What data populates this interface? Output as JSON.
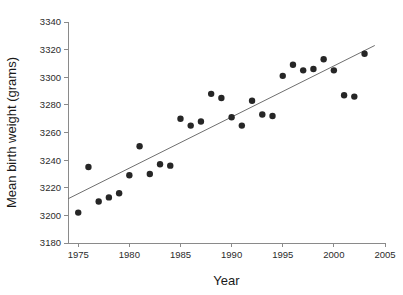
{
  "chart_data": {
    "type": "scatter",
    "title": "",
    "xlabel": "Year",
    "ylabel": "Mean birth weight (grams)",
    "xlim": [
      1974,
      2005
    ],
    "ylim": [
      3180,
      3340
    ],
    "xticks": [
      1975,
      1980,
      1985,
      1990,
      1995,
      2000,
      2005
    ],
    "xtick_labels": [
      "1975",
      "1980",
      "1985",
      "1990",
      "1995",
      "2000",
      "2005"
    ],
    "yticks": [
      3180,
      3200,
      3220,
      3240,
      3260,
      3280,
      3300,
      3320,
      3340
    ],
    "ytick_labels": [
      "3180",
      "3200",
      "3220",
      "3240",
      "3260",
      "3280",
      "3300",
      "3320",
      "3340"
    ],
    "grid": false,
    "legend": false,
    "point_color": "#262626",
    "line_color": "#6f6f6f",
    "axis_color": "#8a8a8a",
    "x": [
      1975,
      1976,
      1977,
      1978,
      1979,
      1980,
      1981,
      1982,
      1983,
      1984,
      1985,
      1986,
      1987,
      1988,
      1989,
      1990,
      1991,
      1992,
      1993,
      1994,
      1995,
      1996,
      1997,
      1998,
      1999,
      2000,
      2001,
      2002,
      2003
    ],
    "y": [
      3202,
      3235,
      3210,
      3213,
      3216,
      3229,
      3250,
      3230,
      3237,
      3236,
      3270,
      3265,
      3268,
      3288,
      3285,
      3271,
      3265,
      3283,
      3273,
      3272,
      3301,
      3309,
      3305,
      3306,
      3313,
      3305,
      3287,
      3286,
      3317
    ],
    "series": [
      {
        "name": "Mean birth weight",
        "points": [
          {
            "x": 1975,
            "y": 3202
          },
          {
            "x": 1976,
            "y": 3235
          },
          {
            "x": 1977,
            "y": 3210
          },
          {
            "x": 1978,
            "y": 3213
          },
          {
            "x": 1979,
            "y": 3216
          },
          {
            "x": 1980,
            "y": 3229
          },
          {
            "x": 1981,
            "y": 3250
          },
          {
            "x": 1982,
            "y": 3230
          },
          {
            "x": 1983,
            "y": 3237
          },
          {
            "x": 1984,
            "y": 3236
          },
          {
            "x": 1985,
            "y": 3270
          },
          {
            "x": 1986,
            "y": 3265
          },
          {
            "x": 1987,
            "y": 3268
          },
          {
            "x": 1988,
            "y": 3288
          },
          {
            "x": 1989,
            "y": 3285
          },
          {
            "x": 1990,
            "y": 3271
          },
          {
            "x": 1991,
            "y": 3265
          },
          {
            "x": 1992,
            "y": 3283
          },
          {
            "x": 1993,
            "y": 3273
          },
          {
            "x": 1994,
            "y": 3272
          },
          {
            "x": 1995,
            "y": 3301
          },
          {
            "x": 1996,
            "y": 3309
          },
          {
            "x": 1997,
            "y": 3305
          },
          {
            "x": 1998,
            "y": 3306
          },
          {
            "x": 1999,
            "y": 3313
          },
          {
            "x": 2000,
            "y": 3305
          },
          {
            "x": 2001,
            "y": 3287
          },
          {
            "x": 2002,
            "y": 3286
          },
          {
            "x": 2003,
            "y": 3317
          }
        ]
      }
    ],
    "trend_line": {
      "type": "linear-fit",
      "x_start": 1974,
      "y_start": 3212,
      "x_end": 2004,
      "y_end": 3323
    }
  }
}
